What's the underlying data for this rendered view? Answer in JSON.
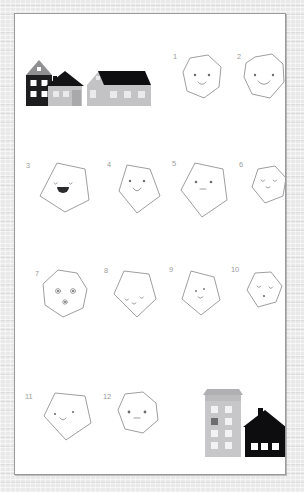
{
  "page": {
    "background_color": "#e9e9ea",
    "sheet_color": "#ffffff",
    "sheet_border_color": "#9a9a9c",
    "outline_color": "#8d8d90",
    "number_color": "#9b9b9d"
  },
  "illustrations": {
    "top_group": {
      "name": "three-houses-row",
      "houses": [
        {
          "name": "tall-dark-house",
          "body_color": "#1d1d1f",
          "roof_color": "#8f8f92",
          "window_color": "#ffffff",
          "windows": 4,
          "attic_window": 1
        },
        {
          "name": "small-gray-house",
          "body_color": "#c3c3c5",
          "roof_color": "#131315",
          "chimney_color": "#131315",
          "window_color": "#eaeaea",
          "windows": 2,
          "door": 1
        },
        {
          "name": "wide-gray-house",
          "body_color": "#c3c3c5",
          "roof_color": "#0e0e10",
          "window_color": "#eaeaea",
          "windows": 3,
          "gable_window": 1
        }
      ]
    },
    "bottom_group": {
      "name": "tower-and-house",
      "buildings": [
        {
          "name": "apartment-tower",
          "body_color": "#c7c7c9",
          "roof_color": "#b0b0b2",
          "window_color": "#f2f2f2",
          "dark_window_color": "#6d6d70",
          "window_rows": 4,
          "window_cols": 2
        },
        {
          "name": "black-house",
          "body_color": "#0d0d0f",
          "roof_color": "#0d0d0f",
          "chimney_color": "#0d0d0f",
          "window_color": "#ffffff",
          "windows": 3
        }
      ]
    }
  },
  "shapes": [
    {
      "number": "1",
      "name": "hexagon-face-1",
      "sides": 6,
      "eyes": "dots",
      "mouth": "small-smile"
    },
    {
      "number": "2",
      "name": "heptagon-face-2",
      "sides": 7,
      "eyes": "dots",
      "mouth": "wide-smile"
    },
    {
      "number": "3",
      "name": "pentagon-face-3",
      "sides": 5,
      "eyes": "curves",
      "mouth": "open-filled"
    },
    {
      "number": "4",
      "name": "pentagon-face-4",
      "sides": 5,
      "eyes": "dots",
      "mouth": "small-smile"
    },
    {
      "number": "5",
      "name": "pentagon-face-5",
      "sides": 5,
      "eyes": "dots",
      "mouth": "flat-line"
    },
    {
      "number": "6",
      "name": "hexagon-face-6",
      "sides": 6,
      "eyes": "curves",
      "mouth": "tiny-curve"
    },
    {
      "number": "7",
      "name": "heptagon-face-7",
      "sides": 7,
      "eyes": "ringed-dots",
      "mouth": "dot"
    },
    {
      "number": "8",
      "name": "pentagon-face-8",
      "sides": 5,
      "eyes": "curves",
      "mouth": "tiny-curve"
    },
    {
      "number": "9",
      "name": "pentagon-face-9",
      "sides": 5,
      "eyes": "tiny",
      "mouth": "tiny-curve"
    },
    {
      "number": "10",
      "name": "hexagon-face-10",
      "sides": 6,
      "eyes": "curves",
      "mouth": "dot"
    },
    {
      "number": "11",
      "name": "pentagon-face-11",
      "sides": 5,
      "eyes": "dots",
      "mouth": "small-smile"
    },
    {
      "number": "12",
      "name": "heptagon-face-12",
      "sides": 7,
      "eyes": "dots",
      "mouth": "flat-line"
    }
  ]
}
